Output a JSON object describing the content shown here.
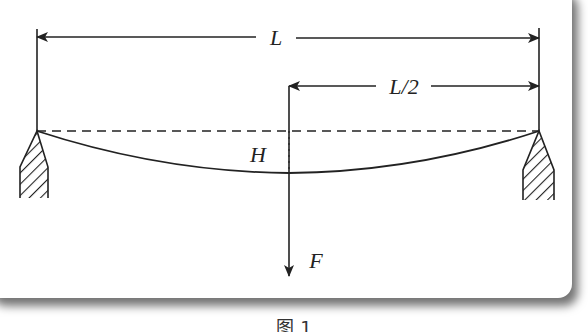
{
  "diagram": {
    "type": "beam-deflection",
    "labels": {
      "span": "L",
      "half_span": "L/2",
      "deflection": "H",
      "force": "F"
    },
    "caption": "图 1",
    "colors": {
      "line": "#222222",
      "background": "#ffffff",
      "shadow": "#8c8c8c"
    }
  }
}
